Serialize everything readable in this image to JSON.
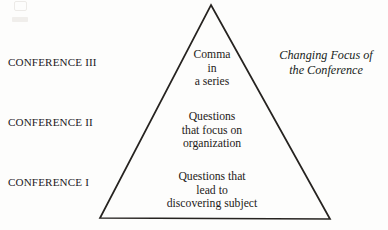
{
  "figure": {
    "background_color": "#fdfdfc",
    "ink_color": "#1c1c1c"
  },
  "conference_labels": [
    {
      "id": "conference-3",
      "text": "CONFERENCE III"
    },
    {
      "id": "conference-2",
      "text": "CONFERENCE II"
    },
    {
      "id": "conference-1",
      "text": "CONFERENCE I"
    }
  ],
  "triangle": {
    "shape": "isosceles-triangle",
    "stroke_color": "#262320",
    "apex": {
      "x": 211,
      "y": 5
    },
    "base_left": {
      "x": 100,
      "y": 218
    },
    "base_right": {
      "x": 330,
      "y": 219
    },
    "tiers": [
      {
        "id": "tier-top",
        "level": "CONFERENCE III",
        "lines": [
          "Comma",
          "in",
          "a series"
        ]
      },
      {
        "id": "tier-middle",
        "level": "CONFERENCE II",
        "lines": [
          "Questions",
          "that focus on",
          "organization"
        ]
      },
      {
        "id": "tier-bottom",
        "level": "CONFERENCE I",
        "lines": [
          "Questions that",
          "lead to",
          "discovering subject"
        ]
      }
    ]
  },
  "caption": {
    "lines": [
      "Changing Focus of",
      "the Conference"
    ],
    "style": "italic"
  }
}
